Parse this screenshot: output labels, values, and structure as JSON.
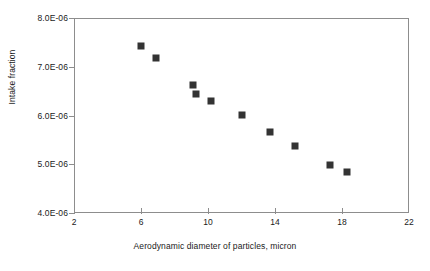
{
  "chart_data": {
    "type": "scatter",
    "title": "",
    "xlabel": "Aerodynamic diameter of particles, micron",
    "ylabel": "Intake fraction",
    "xlim": [
      2,
      22
    ],
    "ylim": [
      4e-06,
      8e-06
    ],
    "grid": false,
    "legend": null,
    "x_ticks": [
      2,
      6,
      10,
      14,
      18,
      22
    ],
    "x_tick_labels": [
      "2",
      "6",
      "10",
      "14",
      "18",
      "22"
    ],
    "y_ticks": [
      4e-06,
      5e-06,
      6e-06,
      7e-06,
      8e-06
    ],
    "y_tick_labels": [
      "4.0E-06",
      "5.0E-06",
      "6.0E-06",
      "7.0E-06",
      "8.0E-06"
    ],
    "marker": {
      "shape": "square",
      "color": "#333333",
      "size": 7
    },
    "series": [
      {
        "name": "Intake fraction",
        "x": [
          6.0,
          6.9,
          9.1,
          9.3,
          10.2,
          12.0,
          13.7,
          15.2,
          17.3,
          18.3
        ],
        "y": [
          7.42e-06,
          7.17e-06,
          6.63e-06,
          6.45e-06,
          6.3e-06,
          6.02e-06,
          5.66e-06,
          5.38e-06,
          4.99e-06,
          4.85e-06
        ]
      }
    ]
  },
  "colors": {
    "marker": "#333333",
    "axis": "#8d8d8d",
    "text": "#1a1a1a",
    "background": "#ffffff"
  }
}
